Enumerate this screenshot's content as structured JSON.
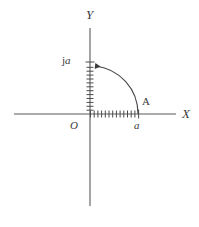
{
  "figure": {
    "title": "",
    "type": "complex-plane-phasor-rotation",
    "background_color": "#ffffff",
    "line_color": "#3b3b3b",
    "width": 199,
    "height": 227
  },
  "axes": {
    "x_label": "X",
    "y_label": "Y",
    "origin_label": "O",
    "x_axis": {
      "x_start": 14,
      "x_end": 176,
      "y": 114
    },
    "y_axis": {
      "y_start": 28,
      "y_end": 206,
      "x": 90
    }
  },
  "ticks": {
    "x_count": 13,
    "y_count": 13,
    "x_spacing": 3.7,
    "y_spacing": 3.9,
    "tick_length": 7,
    "x_from": 90,
    "x_to": 138,
    "y_from": 114,
    "y_to": 62
  },
  "points": [
    {
      "name": "A",
      "label": "A",
      "value_label": "a",
      "x": 138,
      "y": 114
    },
    {
      "name": "ja",
      "label": "ja",
      "x": 90,
      "y": 62
    }
  ],
  "arc": {
    "name": "rotation-arc",
    "radius": 48,
    "center_x": 90,
    "center_y": 114,
    "start_angle_deg": 0,
    "end_angle_deg": 90,
    "direction": "counterclockwise",
    "arrowhead_at": "end"
  },
  "labels": {
    "axis_x": "X",
    "axis_y": "Y",
    "origin": "O",
    "point_a_upper": "A",
    "point_a_lower": "a",
    "imaginary_j": "j",
    "imaginary_a": "a"
  }
}
